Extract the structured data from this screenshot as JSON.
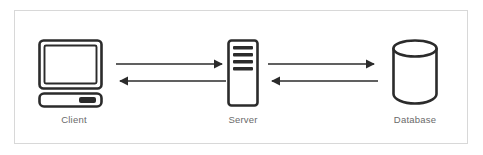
{
  "diagram": {
    "background_color": "#ffffff",
    "frame_border_color": "#d8d8d8",
    "stroke_color": "#2b2b2b",
    "label_color": "#6a6a6a",
    "nodes": [
      {
        "id": "client",
        "label": "Client",
        "icon": "desktop-computer-icon"
      },
      {
        "id": "server",
        "label": "Server",
        "icon": "server-rack-icon"
      },
      {
        "id": "database",
        "label": "Database",
        "icon": "database-cylinder-icon"
      }
    ],
    "connectors": [
      {
        "id": "client-server",
        "from": "Client",
        "to": "Server",
        "arrows": [
          {
            "direction": "right",
            "label": ""
          },
          {
            "direction": "left",
            "label": ""
          }
        ]
      },
      {
        "id": "server-database",
        "from": "Server",
        "to": "Database",
        "arrows": [
          {
            "direction": "right",
            "label": ""
          },
          {
            "direction": "left",
            "label": ""
          }
        ]
      }
    ]
  }
}
